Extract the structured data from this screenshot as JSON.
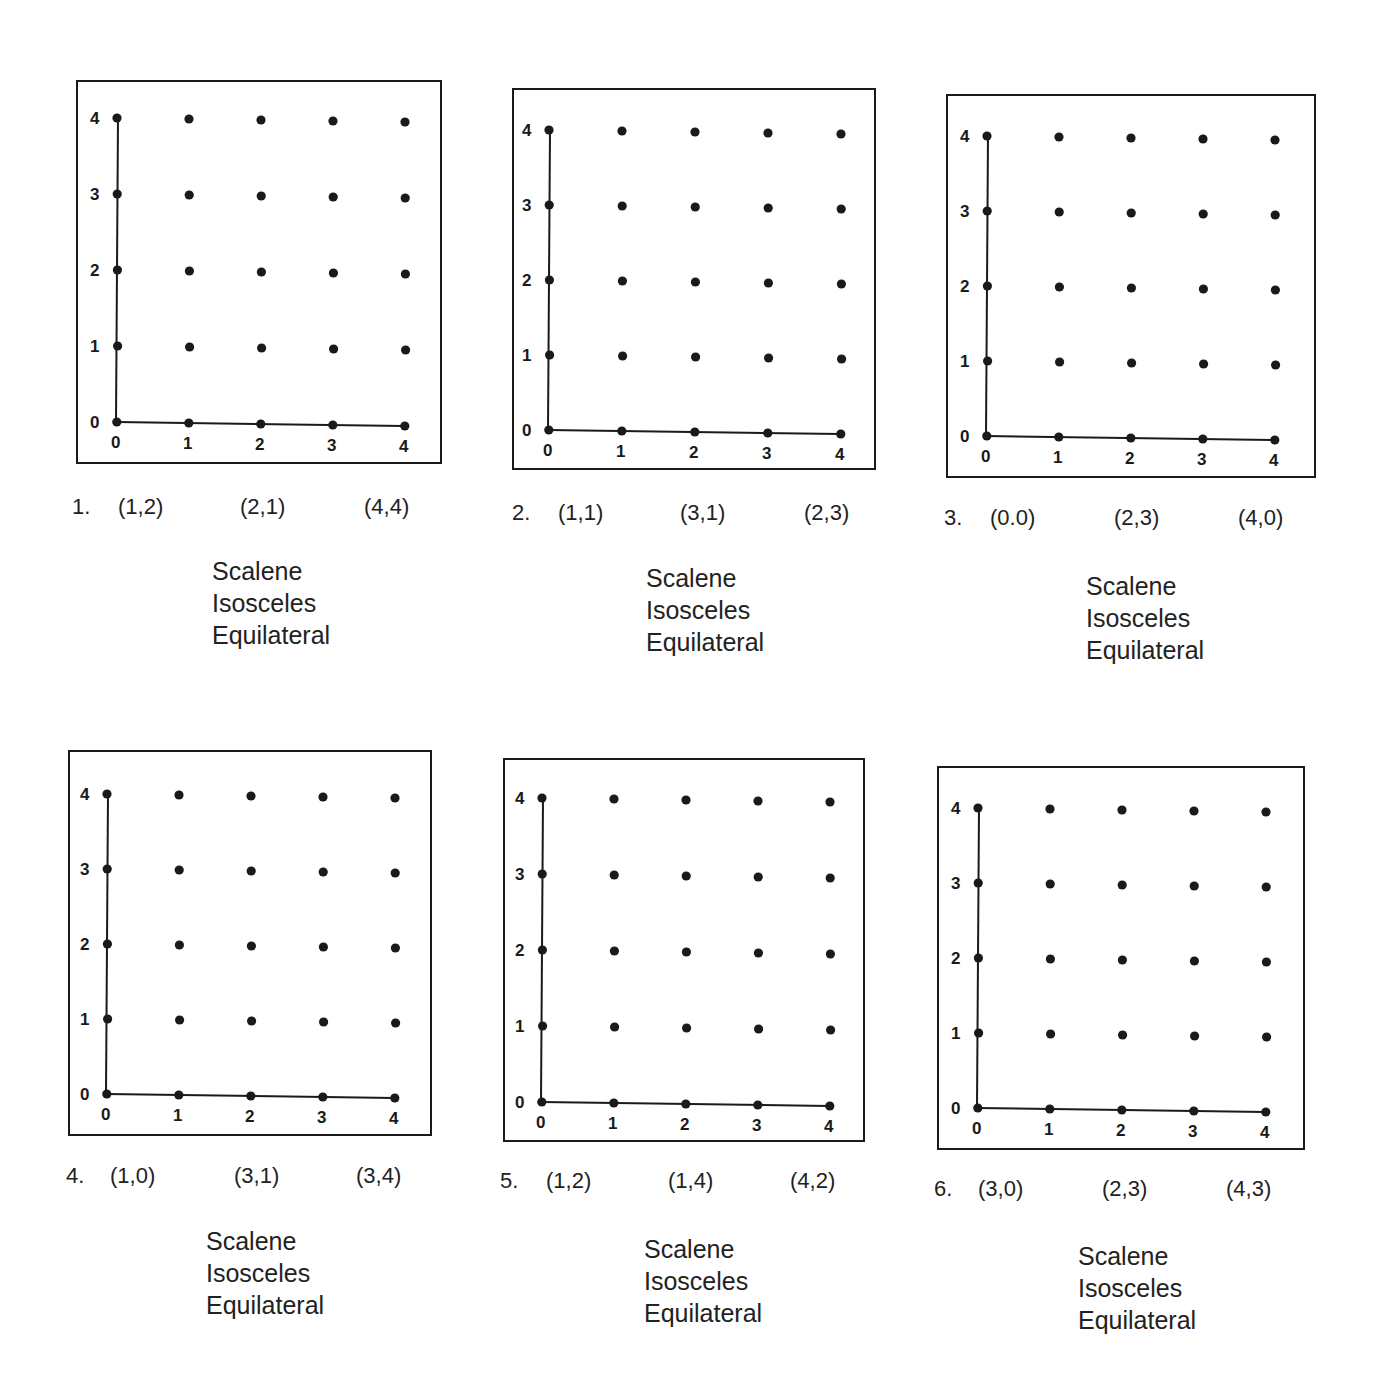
{
  "worksheet": {
    "grid": {
      "x_ticks": [
        "0",
        "1",
        "2",
        "3",
        "4"
      ],
      "y_ticks": [
        "0",
        "1",
        "2",
        "3",
        "4"
      ]
    },
    "choices": [
      "Scalene",
      "Isosceles",
      "Equilateral"
    ],
    "problems": [
      {
        "number": "1.",
        "points": [
          "(1,2)",
          "(2,1)",
          "(4,4)"
        ],
        "choices": [
          "Scalene",
          "Isosceles",
          "Equilateral"
        ]
      },
      {
        "number": "2.",
        "points": [
          "(1,1)",
          "(3,1)",
          "(2,3)"
        ],
        "choices": [
          "Scalene",
          "Isosceles",
          "Equilateral"
        ]
      },
      {
        "number": "3.",
        "points": [
          "(0.0)",
          "(2,3)",
          "(4,0)"
        ],
        "choices": [
          "Scalene",
          "Isosceles",
          "Equilateral"
        ]
      },
      {
        "number": "4.",
        "points": [
          "(1,0)",
          "(3,1)",
          "(3,4)"
        ],
        "choices": [
          "Scalene",
          "Isosceles",
          "Equilateral"
        ]
      },
      {
        "number": "5.",
        "points": [
          "(1,2)",
          "(1,4)",
          "(4,2)"
        ],
        "choices": [
          "Scalene",
          "Isosceles",
          "Equilateral"
        ]
      },
      {
        "number": "6.",
        "points": [
          "(3,0)",
          "(2,3)",
          "(4,3)"
        ],
        "choices": [
          "Scalene",
          "Isosceles",
          "Equilateral"
        ]
      }
    ]
  }
}
